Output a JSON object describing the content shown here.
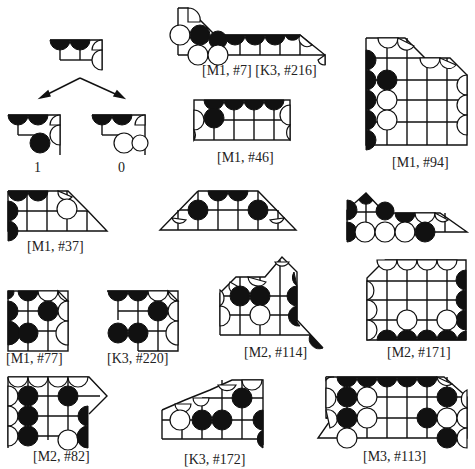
{
  "figure": {
    "labels": {
      "branch_left": "1",
      "branch_right": "0",
      "m1_7_k3_216": "[M1, #7] [K3, #216]",
      "m1_46": "[M1, #46]",
      "m1_94": "[M1, #94]",
      "m1_37": "[M1, #37]",
      "m1_77": "[M1, #77]",
      "k3_220": "[K3, #220]",
      "m2_114": "[M2, #114]",
      "m2_171": "[M2, #171]",
      "m2_82": "[M2, #82]",
      "k3_172": "[K3, #172]",
      "m3_113": "[M3, #113]"
    },
    "colors": {
      "stone_black": "#111111",
      "stone_white": "#ffffff",
      "grid": "#111111"
    }
  }
}
